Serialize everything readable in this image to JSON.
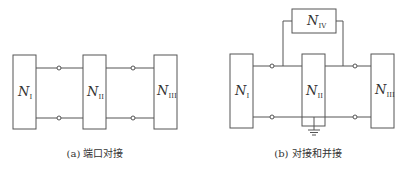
{
  "diagram_a": {
    "caption": "(a) 端口对接",
    "networks": [
      {
        "id": "N1",
        "letter": "N",
        "subscript": "I"
      },
      {
        "id": "N2",
        "letter": "N",
        "subscript": "II"
      },
      {
        "id": "N3",
        "letter": "N",
        "subscript": "III"
      }
    ],
    "connections": [
      {
        "from": "N1",
        "to": "N2",
        "type": "port-to-port",
        "terminals": 2
      },
      {
        "from": "N2",
        "to": "N3",
        "type": "port-to-port",
        "terminals": 2
      }
    ]
  },
  "diagram_b": {
    "caption": "(b) 对接和并接",
    "networks": [
      {
        "id": "N1",
        "letter": "N",
        "subscript": "I"
      },
      {
        "id": "N2",
        "letter": "N",
        "subscript": "II"
      },
      {
        "id": "N3",
        "letter": "N",
        "subscript": "III"
      },
      {
        "id": "N4",
        "letter": "N",
        "subscript": "IV"
      }
    ],
    "connections": [
      {
        "from": "N1",
        "to": "N2",
        "type": "port-to-port",
        "terminals": 2
      },
      {
        "from": "N2",
        "to": "N3",
        "type": "port-to-port",
        "terminals": 2
      },
      {
        "from": "N4",
        "to": "N2",
        "type": "parallel",
        "note": "N_IV bridges across N_II on top line"
      }
    ],
    "ground": "ground symbol below N_II on common bottom line"
  },
  "colors": {
    "line": "#555555",
    "text": "#333333",
    "background": "#ffffff"
  }
}
